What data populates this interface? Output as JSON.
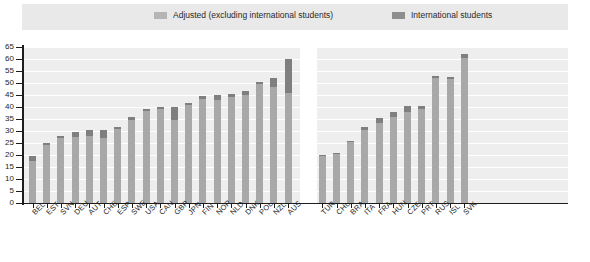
{
  "legend": {
    "items": [
      {
        "label": "Adjusted (excluding international students)",
        "color": "#b5b5b5",
        "icon": "legend-swatch-icon"
      },
      {
        "label": "International students",
        "color": "#8e8e8e",
        "icon": "legend-swatch-icon"
      }
    ]
  },
  "axis": {
    "y_ticks": [
      "0",
      "5",
      "10",
      "15",
      "20",
      "25",
      "30",
      "35",
      "40",
      "45",
      "50",
      "55",
      "60",
      "65"
    ]
  },
  "chart_data": {
    "type": "bar",
    "title": "",
    "subtitle": "",
    "xlabel": "",
    "ylabel": "",
    "ylim": [
      0,
      65
    ],
    "ytick_step": 5,
    "grid": true,
    "stacked": true,
    "legend_position": "top",
    "legend": [
      "Adjusted (excluding international students)",
      "International students"
    ],
    "colors": {
      "adjusted": "#a8a8a8",
      "international": "#7f7f7f",
      "plot_background": "#eeeeee",
      "gridline": "#ffffff",
      "axis": "#1d1d1d"
    },
    "groups": [
      {
        "name": "group-1",
        "categories": [
          "BEL",
          "EST",
          "SVN",
          "DEU",
          "AUT",
          "CHE",
          "ESP",
          "SWE",
          "USA",
          "CAN",
          "GBR",
          "JPN",
          "FIN",
          "NOR",
          "NLD",
          "DNK",
          "POL",
          "NZL",
          "AUS"
        ],
        "series": [
          {
            "name": "Adjusted (excluding international students)",
            "values": [
              17.5,
              24.0,
              27.0,
              27.5,
              28.0,
              27.0,
              31.0,
              34.5,
              38.5,
              39.0,
              34.5,
              41.0,
              43.5,
              43.0,
              44.0,
              45.0,
              49.5,
              48.5,
              46.0
            ]
          },
          {
            "name": "International students",
            "values": [
              2.0,
              0.8,
              0.8,
              2.0,
              2.5,
              3.5,
              0.8,
              1.5,
              0.8,
              1.0,
              5.5,
              0.8,
              1.0,
              2.0,
              1.5,
              1.5,
              0.8,
              3.5,
              14.0
            ]
          }
        ],
        "totals": [
          19.5,
          24.8,
          27.8,
          29.5,
          30.5,
          30.5,
          31.8,
          36.0,
          39.3,
          40.0,
          40.0,
          41.8,
          44.5,
          45.0,
          45.5,
          46.5,
          50.3,
          52.0,
          60.0
        ]
      },
      {
        "name": "group-2",
        "categories": [
          "TUR",
          "CHL",
          "BRA",
          "ITA",
          "FRA",
          "HUN",
          "CZE",
          "PRT",
          "RUS",
          "ISL",
          "SVK"
        ],
        "series": [
          {
            "name": "Adjusted (excluding international students)",
            "values": [
              19.5,
              20.5,
              25.5,
              30.5,
              33.5,
              36.0,
              38.0,
              39.0,
              52.0,
              51.5,
              60.5
            ]
          },
          {
            "name": "International students",
            "values": [
              0.5,
              0.5,
              0.5,
              1.0,
              2.0,
              2.0,
              2.5,
              1.5,
              0.8,
              1.0,
              1.5
            ]
          }
        ],
        "totals": [
          20.0,
          21.0,
          26.0,
          31.5,
          35.5,
          38.0,
          40.5,
          40.5,
          52.8,
          52.5,
          62.0
        ]
      }
    ]
  }
}
